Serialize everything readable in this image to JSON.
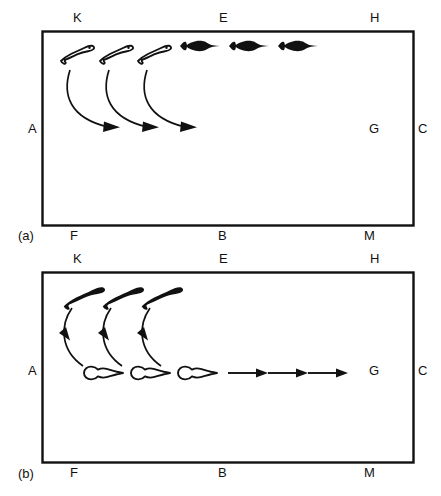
{
  "figure": {
    "background_color": "#ffffff",
    "ink_color": "#111111",
    "width": 441,
    "height": 496
  },
  "panels": [
    {
      "tag": "(a)",
      "tag_x": 18,
      "tag_y": 228,
      "box": {
        "x": 42,
        "y": 31,
        "w": 371,
        "h": 194
      },
      "labels": [
        {
          "key": "K",
          "text": "K",
          "x": 73,
          "y": 11,
          "align": "top"
        },
        {
          "key": "E",
          "text": "E",
          "x": 219,
          "y": 11,
          "align": "top"
        },
        {
          "key": "H",
          "text": "H",
          "x": 370,
          "y": 11,
          "align": "top"
        },
        {
          "key": "A",
          "text": "A",
          "x": 28,
          "y": 122,
          "align": "left"
        },
        {
          "key": "G",
          "text": "G",
          "x": 369,
          "y": 122,
          "align": "right-inside"
        },
        {
          "key": "C",
          "text": "C",
          "x": 418,
          "y": 122,
          "align": "right-outside"
        },
        {
          "key": "F",
          "text": "F",
          "x": 70,
          "y": 229,
          "align": "bottom"
        },
        {
          "key": "B",
          "text": "B",
          "x": 218,
          "y": 229,
          "align": "bottom"
        },
        {
          "key": "M",
          "text": "M",
          "x": 364,
          "y": 229,
          "align": "bottom"
        }
      ],
      "outline_fish": [
        {
          "x": 78,
          "y": 52
        },
        {
          "x": 117,
          "y": 52
        },
        {
          "x": 155,
          "y": 52
        }
      ],
      "filled_fish": [
        {
          "x": 200,
          "y": 46
        },
        {
          "x": 248,
          "y": 46
        },
        {
          "x": 297,
          "y": 46
        }
      ],
      "curved_arrows": [
        {
          "from_x": 72,
          "from_y": 67,
          "to_x": 120,
          "to_y": 127
        },
        {
          "from_x": 111,
          "from_y": 67,
          "to_x": 159,
          "to_y": 127
        },
        {
          "from_x": 149,
          "from_y": 67,
          "to_x": 197,
          "to_y": 127
        }
      ],
      "straight_arrows": []
    },
    {
      "tag": "(b)",
      "tag_x": 18,
      "tag_y": 466,
      "box": {
        "x": 42,
        "y": 272,
        "w": 371,
        "h": 190
      },
      "labels": [
        {
          "key": "K",
          "text": "K",
          "x": 73,
          "y": 252,
          "align": "top"
        },
        {
          "key": "E",
          "text": "E",
          "x": 219,
          "y": 252,
          "align": "top"
        },
        {
          "key": "H",
          "text": "H",
          "x": 370,
          "y": 252,
          "align": "top"
        },
        {
          "key": "A",
          "text": "A",
          "x": 28,
          "y": 364,
          "align": "left"
        },
        {
          "key": "G",
          "text": "G",
          "x": 369,
          "y": 364,
          "align": "right-inside"
        },
        {
          "key": "C",
          "text": "C",
          "x": 418,
          "y": 364,
          "align": "right-outside"
        },
        {
          "key": "F",
          "text": "F",
          "x": 70,
          "y": 466,
          "align": "bottom"
        },
        {
          "key": "B",
          "text": "B",
          "x": 218,
          "y": 466,
          "align": "bottom"
        },
        {
          "key": "M",
          "text": "M",
          "x": 364,
          "y": 466,
          "align": "bottom"
        }
      ],
      "filled_fish": [
        {
          "x": 85,
          "y": 295
        },
        {
          "x": 124,
          "y": 295
        },
        {
          "x": 163,
          "y": 295
        }
      ],
      "outline_fish": [
        {
          "x": 103,
          "y": 372
        },
        {
          "x": 150,
          "y": 372
        },
        {
          "x": 196,
          "y": 372
        }
      ],
      "curved_arrows": [
        {
          "from_x": 73,
          "from_y": 312,
          "to_x": 85,
          "to_y": 365
        },
        {
          "from_x": 112,
          "from_y": 312,
          "to_x": 124,
          "to_y": 365
        },
        {
          "from_x": 150,
          "from_y": 312,
          "to_x": 162,
          "to_y": 365
        }
      ],
      "straight_arrows": [
        {
          "x1": 228,
          "y1": 373,
          "x2": 267,
          "y2": 373
        },
        {
          "x1": 268,
          "y1": 373,
          "x2": 307,
          "y2": 373
        },
        {
          "x1": 308,
          "y1": 373,
          "x2": 347,
          "y2": 373
        }
      ]
    }
  ]
}
